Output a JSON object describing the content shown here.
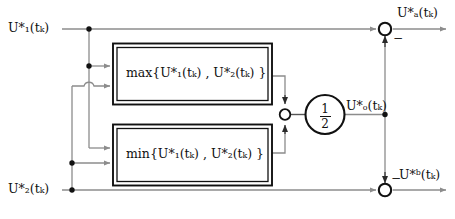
{
  "diagram": {
    "colors": {
      "wire": "#8c8c8c",
      "box_border": "#111111",
      "node_dot": "#111111",
      "text": "#111111",
      "background": "#ffffff"
    },
    "inputs": [
      {
        "id": "u1",
        "label": "U*₁(tₖ)",
        "plain": "U1*(tk)",
        "position": "left-top"
      },
      {
        "id": "u2",
        "label": "U*₂(tₖ)",
        "plain": "U2*(tk)",
        "position": "left-bottom"
      }
    ],
    "blocks": [
      {
        "id": "max-block",
        "label": "max{U*₁(tₖ) , U*₂(tₖ) }",
        "operator": "max",
        "args": [
          "U1*(tk)",
          "U2*(tk)"
        ]
      },
      {
        "id": "min-block",
        "label": "min{U*₁(tₖ) , U*₂(tₖ) }",
        "operator": "min",
        "args": [
          "U1*(tk)",
          "U2*(tk)"
        ]
      }
    ],
    "gain": {
      "id": "half-gain",
      "numerator": "1",
      "denominator": "2",
      "label": "1/2"
    },
    "signals": [
      {
        "id": "uo",
        "label": "U*ₒ(tₖ)",
        "plain": "Uo*(tk)",
        "role": "gain-output"
      }
    ],
    "outputs": [
      {
        "id": "ua",
        "label": "U*ₐ(tₖ)",
        "plain": "Ua*(tk)",
        "sign": "−",
        "position": "right-top"
      },
      {
        "id": "ub",
        "label": "U*ᵇ(tₖ)",
        "plain": "Ub*(tk)",
        "sign": "−",
        "position": "right-bottom"
      }
    ],
    "junction_signs": {
      "sum_mid_top": "▼",
      "sum_mid_bottom": "▲",
      "ua_minus": "−",
      "ub_minus": "−"
    },
    "nodes": [
      {
        "id": "node-u1-branch",
        "type": "junction-dot"
      },
      {
        "id": "node-u1-to-blocks",
        "type": "junction-dot"
      },
      {
        "id": "node-u2-branch",
        "type": "junction-dot"
      },
      {
        "id": "node-u2-to-blocks",
        "type": "junction-dot"
      },
      {
        "id": "node-uo-branch",
        "type": "junction-dot"
      }
    ],
    "summing_junctions": [
      {
        "id": "sum-mid",
        "style": "small-open-circle"
      },
      {
        "id": "sum-ua",
        "style": "open-circle"
      },
      {
        "id": "sum-ub",
        "style": "open-circle"
      }
    ],
    "wire_hop": {
      "id": "line-hop",
      "type": "semicircle-bridge"
    }
  }
}
